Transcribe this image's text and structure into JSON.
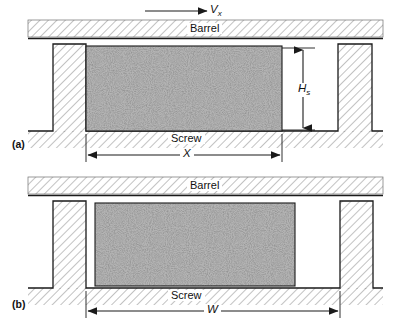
{
  "figure": {
    "type": "technical-diagram",
    "colors": {
      "line": "#1a1a1a",
      "hatch": "#8a8a8a",
      "material_fill": "#b0b0b0",
      "material_speckle": "#3a3a3a",
      "background": "#ffffff"
    }
  },
  "panels": [
    {
      "id": "a",
      "label": "(a)",
      "barrel_label": "Barrel",
      "screw_label": "Screw",
      "velocity": {
        "symbol": "V",
        "subscript": "x",
        "arrow_direction": "right"
      },
      "dimensions": [
        {
          "name": "channel-depth",
          "symbol": "H",
          "subscript": "s",
          "orientation": "vertical"
        },
        {
          "name": "solid-bed-width",
          "symbol": "X",
          "subscript": "",
          "orientation": "horizontal"
        }
      ]
    },
    {
      "id": "b",
      "label": "(b)",
      "barrel_label": "Barrel",
      "screw_label": "Screw",
      "dimensions": [
        {
          "name": "channel-width",
          "symbol": "W",
          "subscript": "",
          "orientation": "horizontal"
        }
      ]
    }
  ],
  "labels": {
    "barrel_a": "Barrel",
    "barrel_b": "Barrel",
    "screw_a": "Screw",
    "screw_b": "Screw",
    "panel_a": "(a)",
    "panel_b": "(b)",
    "velocity_symbol": "V",
    "velocity_subscript": "x",
    "depth_symbol": "H",
    "depth_subscript": "s",
    "solidbed_symbol": "X",
    "width_symbol": "W"
  }
}
